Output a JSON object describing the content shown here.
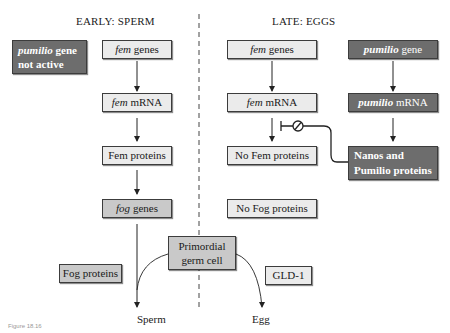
{
  "headers": {
    "early": "EARLY: SPERM",
    "late": "LATE: EGGS"
  },
  "early": {
    "pumilio_inactive": {
      "italic": "pumilio",
      "rest": " gene",
      "line2": "not active"
    },
    "fem_genes": {
      "italic": "fem",
      "rest": " genes"
    },
    "fem_mrna": {
      "italic": "fem",
      "rest": " mRNA"
    },
    "fem_proteins": "Fem proteins",
    "fog_genes": {
      "italic": "fog",
      "rest": " genes"
    },
    "fog_proteins": "Fog proteins",
    "outcome": "Sperm"
  },
  "late": {
    "fem_genes": {
      "italic": "fem",
      "rest": " genes"
    },
    "fem_mrna": {
      "italic": "fem",
      "rest": " mRNA"
    },
    "no_fem_proteins": "No Fem proteins",
    "no_fog_proteins": "No Fog proteins",
    "pumilio_gene": {
      "italic": "pumilio",
      "rest": " gene"
    },
    "pumilio_mrna": {
      "italic": "pumilio",
      "rest": " mRNA"
    },
    "nanos_pumilio": {
      "line1": "Nanos and",
      "line2": "Pumilio proteins"
    },
    "gld1": "GLD-1",
    "outcome": "Egg"
  },
  "center": {
    "primordial": {
      "line1": "Primordial",
      "line2": "germ cell"
    }
  },
  "caption": "Figure 18.16",
  "colors": {
    "light_box": "#ebebeb",
    "mid_box": "#c9c9c9",
    "dark_box": "#6d6d6d",
    "line": "#222222"
  }
}
